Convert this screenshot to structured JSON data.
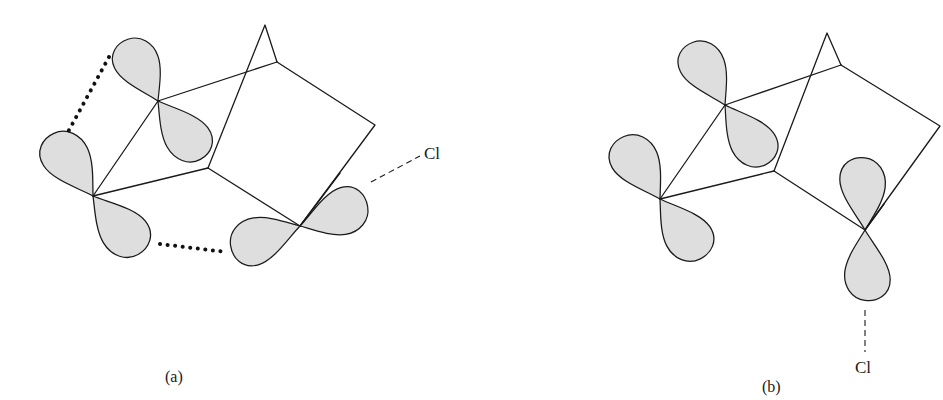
{
  "figure": {
    "panels": [
      {
        "id": "a",
        "caption": "(a)",
        "substituent_label": "Cl",
        "description": "Bicyclic framework with three p-orbital pairs; dotted lines show overlap between adjacent lobes; C–Cl bond aligned with the p orbital"
      },
      {
        "id": "b",
        "caption": "(b)",
        "substituent_label": "Cl",
        "description": "Bicyclic framework with three p-orbital pairs; C–Cl bond axis vertical, no overlap shown"
      }
    ],
    "colors": {
      "lobe_fill": "#dedede",
      "line": "#1a1a1a",
      "background": "#ffffff"
    }
  }
}
